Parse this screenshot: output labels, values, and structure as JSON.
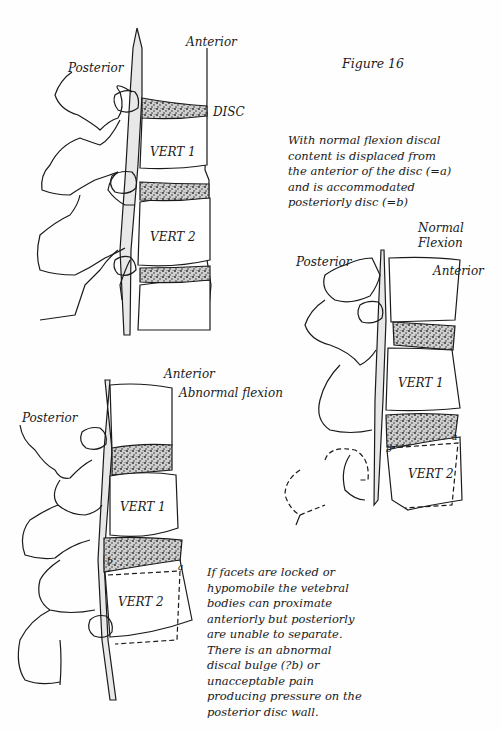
{
  "figure": {
    "title": "Figure 16"
  },
  "diagram_top": {
    "labels": {
      "anterior": "Anterior",
      "posterior": "Posterior",
      "disc": "DISC",
      "vert1": "VERT 1",
      "vert2": "VERT 2"
    }
  },
  "diagram_normal": {
    "labels": {
      "title_line1": "Normal",
      "title_line2": "Flexion",
      "posterior": "Posterior",
      "anterior": "Anterior",
      "vert1": "VERT 1",
      "vert2": "VERT 2",
      "point_a": "a",
      "point_b": "b"
    },
    "caption": "With normal flexion discal content is displaced from the anterior of the disc (=a) and is accommodated posteriorly disc (=b)"
  },
  "diagram_abnormal": {
    "labels": {
      "anterior": "Anterior",
      "title": "Abnormal flexion",
      "posterior": "Posterior",
      "vert1": "VERT 1",
      "vert2": "VERT 2",
      "point_a": "a",
      "point_b": "b"
    },
    "caption": "If facets are locked or hypomobile the vetebral bodies can proximate anteriorly but posteriorly are unable to separate. There is an abnormal discal bulge (?b) or unacceptable pain producing pressure on the posterior disc wall."
  },
  "colors": {
    "ink": "#1a1a1a",
    "paper": "#fefefe",
    "cord_fill": "#e8e8e8"
  }
}
